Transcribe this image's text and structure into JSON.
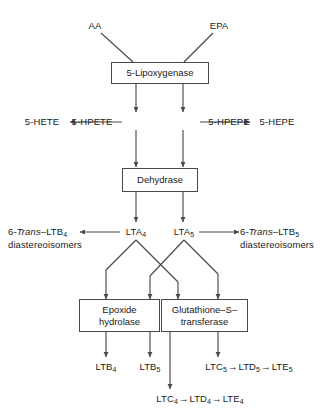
{
  "figure": {
    "background_color": "#ffffff",
    "line_color": "#4a4a4a",
    "text_color": "#1a1a1a"
  },
  "substrates": {
    "aa": "AA",
    "epa": "EPA"
  },
  "enzymes": {
    "lipoxygenase": "5-Lipoxygenase",
    "dehydrase": "Dehydrase",
    "epoxide_hydrolase_line1": "Epoxide",
    "epoxide_hydrolase_line2": "hydrolase",
    "glutathione_transferase_line1": "Glutathione–S–",
    "glutathione_transferase_line2": "transferase"
  },
  "intermediates": {
    "hpete": "5-HPETE",
    "hpepe": "5-HPEPE",
    "hete": "5-HETE",
    "hepe": "5-HEPE",
    "lta4_base": "LTA",
    "lta4_sub": "4",
    "lta5_base": "LTA",
    "lta5_sub": "5"
  },
  "diastereoisomers": {
    "left_prefix": "6-",
    "left_italic": "Trans",
    "left_suffix": "–LTB",
    "left_sub": "4",
    "left_line2": "diastereoisomers",
    "right_prefix": "6-",
    "right_italic": "Trans",
    "right_suffix": "–LTB",
    "right_sub": "5",
    "right_line2": "diastereoisomers"
  },
  "products": {
    "ltb4_base": "LTB",
    "ltb4_sub": "4",
    "ltb5_base": "LTB",
    "ltb5_sub": "5",
    "series5_chain": [
      {
        "base": "LTC",
        "sub": "5"
      },
      {
        "base": "LTD",
        "sub": "5"
      },
      {
        "base": "LTE",
        "sub": "5"
      }
    ],
    "series4_chain": [
      {
        "base": "LTC",
        "sub": "4"
      },
      {
        "base": "LTD",
        "sub": "4"
      },
      {
        "base": "LTE",
        "sub": "4"
      }
    ],
    "chain_arrow": "→"
  }
}
